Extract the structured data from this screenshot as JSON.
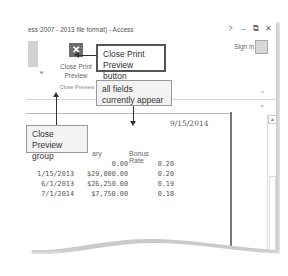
{
  "window": {
    "title": "ess 2007 - 2013 file format) - Access",
    "controls": {
      "help": "?",
      "minimize": "–",
      "restore": "⧉",
      "close": "✕"
    },
    "sign_in": "Sign in"
  },
  "ribbon": {
    "partial_button_label": "e",
    "close_print_preview": {
      "icon": "close-x-icon",
      "glyph": "✕",
      "label_line1": "Close Print",
      "label_line2": "Preview"
    },
    "group_label": "Close Preview",
    "collapse_glyph": "^",
    "close_glyph": "×"
  },
  "report": {
    "date": "9/15/2014",
    "columns": [
      "ary",
      "Bonus Rate"
    ],
    "rows": [
      {
        "date": "",
        "salary": "0.00",
        "bonus": "0.20"
      },
      {
        "date": "1/15/2013",
        "salary": "$29,000.00",
        "bonus": "0.20"
      },
      {
        "date": "6/1/2013",
        "salary": "$26,250.00",
        "bonus": "0.19"
      },
      {
        "date": "7/1/2014",
        "salary": "$7,750.00",
        "bonus": "0.18"
      }
    ]
  },
  "callouts": {
    "close_print_preview_button": "Close Print Preview button",
    "all_fields": "all fields currently appear",
    "close_preview_group": "Close Preview group"
  }
}
